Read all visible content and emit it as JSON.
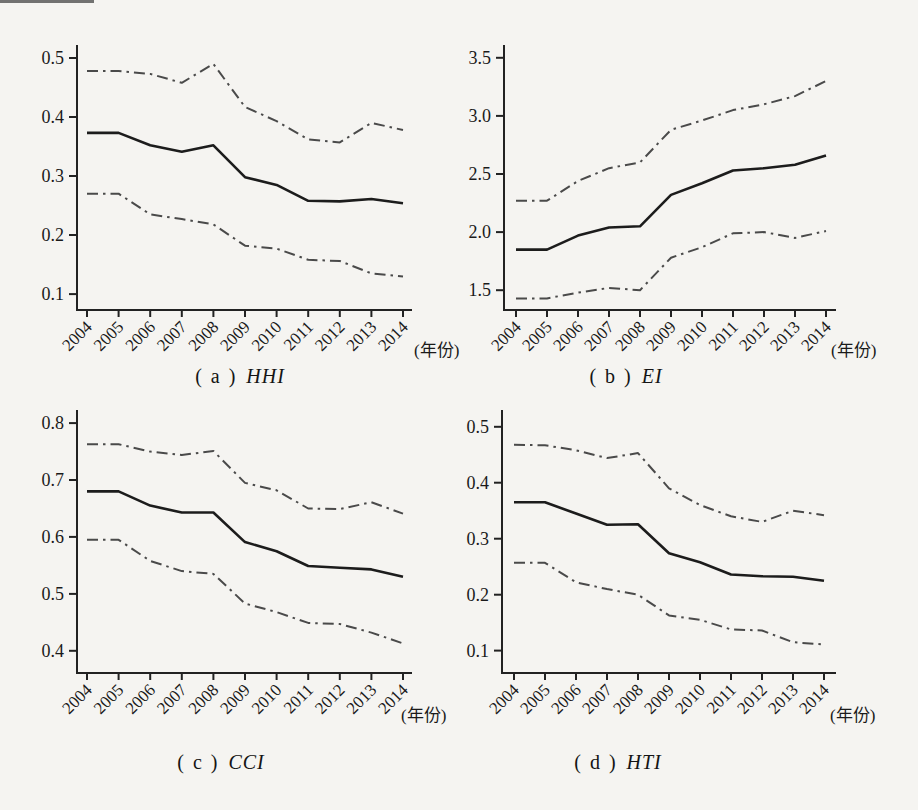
{
  "colors": {
    "paper": "#f5f4f1",
    "axis": "#222222",
    "solid_line": "#1c1c1c",
    "dashed_line": "#4a4a4a",
    "text": "#1a1a1a"
  },
  "chart_data": [
    {
      "id": "hhi",
      "type": "line",
      "caption": {
        "prefix": "( a )",
        "label": "HHI"
      },
      "xlabel": "(年份)",
      "categories": [
        "2004",
        "2005",
        "2006",
        "2007",
        "2008",
        "2009",
        "2010",
        "2011",
        "2012",
        "2013",
        "2014"
      ],
      "yticks": [
        0.1,
        0.2,
        0.3,
        0.4,
        0.5
      ],
      "ytick_labels": [
        "0.1",
        "0.2",
        "0.3",
        "0.4",
        "0.5"
      ],
      "ylim": [
        0.073,
        0.522
      ],
      "grid": false,
      "series": [
        {
          "name": "upper-bound",
          "style": "dashdot",
          "values": [
            0.478,
            0.478,
            0.473,
            0.458,
            0.49,
            0.417,
            0.393,
            0.362,
            0.357,
            0.39,
            0.378
          ]
        },
        {
          "name": "mean",
          "style": "solid",
          "values": [
            0.373,
            0.373,
            0.352,
            0.341,
            0.352,
            0.298,
            0.285,
            0.258,
            0.257,
            0.261,
            0.254
          ]
        },
        {
          "name": "lower-bound",
          "style": "dashdot",
          "values": [
            0.27,
            0.27,
            0.235,
            0.227,
            0.218,
            0.182,
            0.177,
            0.158,
            0.156,
            0.135,
            0.13
          ]
        }
      ]
    },
    {
      "id": "ei",
      "type": "line",
      "caption": {
        "prefix": "( b )",
        "label": "EI"
      },
      "xlabel": "(年份)",
      "categories": [
        "2004",
        "2005",
        "2006",
        "2007",
        "2008",
        "2009",
        "2010",
        "2011",
        "2012",
        "2013",
        "2014"
      ],
      "yticks": [
        1.5,
        2.0,
        2.5,
        3.0,
        3.5
      ],
      "ytick_labels": [
        "1.5",
        "2.0",
        "2.5",
        "3.0",
        "3.5"
      ],
      "ylim": [
        1.33,
        3.61
      ],
      "grid": false,
      "series": [
        {
          "name": "upper-bound",
          "style": "dashdot",
          "values": [
            2.27,
            2.27,
            2.44,
            2.55,
            2.6,
            2.88,
            2.96,
            3.05,
            3.1,
            3.17,
            3.3
          ]
        },
        {
          "name": "mean",
          "style": "solid",
          "values": [
            1.85,
            1.85,
            1.97,
            2.04,
            2.05,
            2.32,
            2.42,
            2.53,
            2.55,
            2.58,
            2.66
          ]
        },
        {
          "name": "lower-bound",
          "style": "dashdot",
          "values": [
            1.43,
            1.43,
            1.48,
            1.52,
            1.5,
            1.78,
            1.87,
            1.99,
            2.0,
            1.95,
            2.01
          ]
        }
      ]
    },
    {
      "id": "cci",
      "type": "line",
      "caption": {
        "prefix": "( c )",
        "label": "CCI"
      },
      "xlabel": "(年份)",
      "categories": [
        "2004",
        "2005",
        "2006",
        "2007",
        "2008",
        "2009",
        "2010",
        "2011",
        "2012",
        "2013",
        "2014"
      ],
      "yticks": [
        0.4,
        0.5,
        0.6,
        0.7,
        0.8
      ],
      "ytick_labels": [
        "0.4",
        "0.5",
        "0.6",
        "0.7",
        "0.8"
      ],
      "ylim": [
        0.361,
        0.823
      ],
      "grid": false,
      "series": [
        {
          "name": "upper-bound",
          "style": "dashdot",
          "values": [
            0.763,
            0.763,
            0.75,
            0.744,
            0.751,
            0.695,
            0.682,
            0.65,
            0.649,
            0.661,
            0.641
          ]
        },
        {
          "name": "mean",
          "style": "solid",
          "values": [
            0.68,
            0.68,
            0.655,
            0.643,
            0.643,
            0.591,
            0.575,
            0.549,
            0.546,
            0.543,
            0.53
          ]
        },
        {
          "name": "lower-bound",
          "style": "dashdot",
          "values": [
            0.595,
            0.595,
            0.558,
            0.54,
            0.535,
            0.483,
            0.468,
            0.449,
            0.447,
            0.432,
            0.413
          ]
        }
      ]
    },
    {
      "id": "hti",
      "type": "line",
      "caption": {
        "prefix": "( d )",
        "label": "HTI"
      },
      "xlabel": "(年份)",
      "categories": [
        "2004",
        "2005",
        "2006",
        "2007",
        "2008",
        "2009",
        "2010",
        "2011",
        "2012",
        "2013",
        "2014"
      ],
      "yticks": [
        0.1,
        0.2,
        0.3,
        0.4,
        0.5
      ],
      "ytick_labels": [
        "0.1",
        "0.2",
        "0.3",
        "0.4",
        "0.5"
      ],
      "ylim": [
        0.06,
        0.53
      ],
      "grid": false,
      "series": [
        {
          "name": "upper-bound",
          "style": "dashdot",
          "values": [
            0.468,
            0.467,
            0.458,
            0.444,
            0.453,
            0.39,
            0.36,
            0.34,
            0.33,
            0.35,
            0.342
          ]
        },
        {
          "name": "mean",
          "style": "solid",
          "values": [
            0.365,
            0.365,
            0.345,
            0.325,
            0.326,
            0.274,
            0.258,
            0.236,
            0.233,
            0.232,
            0.225
          ]
        },
        {
          "name": "lower-bound",
          "style": "dashdot",
          "values": [
            0.257,
            0.257,
            0.222,
            0.21,
            0.2,
            0.163,
            0.155,
            0.138,
            0.136,
            0.115,
            0.111
          ]
        }
      ]
    }
  ]
}
